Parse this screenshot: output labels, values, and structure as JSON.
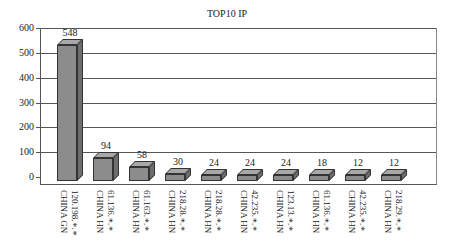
{
  "chart_data": {
    "type": "bar",
    "style": "3d",
    "title": "TOP10 IP",
    "xlabel": "",
    "ylabel": "",
    "ylim": [
      0,
      600
    ],
    "yticks": [
      0,
      100,
      200,
      300,
      400,
      500,
      600
    ],
    "grid": true,
    "legend": null,
    "categories": [
      {
        "ip": "120.198.*.*",
        "region": "CHINA GN"
      },
      {
        "ip": "61.136.*.*",
        "region": "CHINA HN"
      },
      {
        "ip": "61.163.*.*",
        "region": "CHINA HN"
      },
      {
        "ip": "218.28.*.*",
        "region": "CHINA HN"
      },
      {
        "ip": "218.28.*.*",
        "region": "CHINA HN"
      },
      {
        "ip": "42.235.*.*",
        "region": "CHINA HN"
      },
      {
        "ip": "123.13.*.*",
        "region": "CHINA HN"
      },
      {
        "ip": "61.136.*.*",
        "region": "CHINA HN"
      },
      {
        "ip": "42.235.*.*",
        "region": "CHINA HN"
      },
      {
        "ip": "218.29.*.*",
        "region": "CHINA HN"
      }
    ],
    "values": [
      548,
      94,
      58,
      30,
      24,
      24,
      24,
      18,
      12,
      12
    ],
    "data_labels": [
      "548",
      "94",
      "58",
      "30",
      "24",
      "24",
      "24",
      "18",
      "12",
      "12"
    ]
  }
}
